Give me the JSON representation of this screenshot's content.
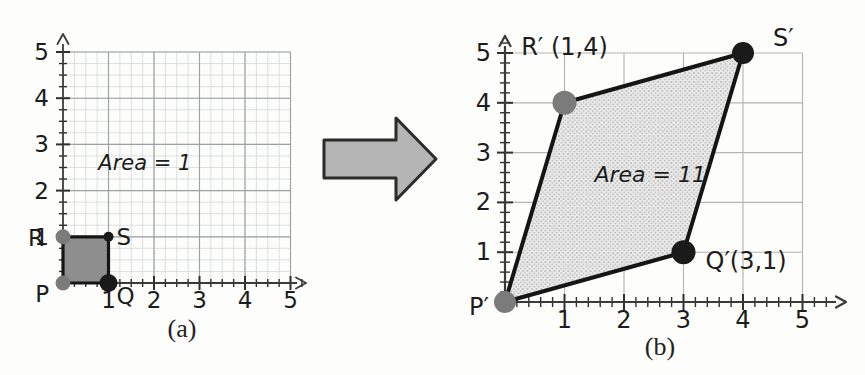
{
  "figure": {
    "captions": {
      "a": "(a)",
      "b": "(b)"
    },
    "colors": {
      "background": "#fdfdfb",
      "fine_grid": "#ced3d7",
      "major_grid_a": "#9ca1a5",
      "grid_b": "#b5b5b5",
      "axis": "#3a3a3a",
      "tick": "#2f2f2f",
      "text": "#1c1c1c",
      "square_fill": "#8e8e8e",
      "parallelogram_fill_base": "#eaeaea",
      "parallelogram_stipple": "#969696",
      "shape_stroke": "#151515",
      "gray_dot": "#7b7b7b",
      "black_dot": "#1a1a1a",
      "arrow_fill": "#b5b5b5",
      "arrow_stroke": "#2b2b2b"
    },
    "transform_arrow": {
      "direction": "right"
    }
  },
  "chart_data": [
    {
      "id": "a",
      "type": "scatter",
      "caption": "(a)",
      "xlim": [
        0,
        5
      ],
      "ylim": [
        0,
        5
      ],
      "x_tick_labels": [
        "1",
        "2",
        "3",
        "4",
        "5"
      ],
      "y_tick_labels": [
        "1",
        "2",
        "3",
        "4",
        "5"
      ],
      "minor_tick_step": 0.25,
      "grid": {
        "fine": true,
        "major": true
      },
      "area_annotation": {
        "text": "Area = 1",
        "x": 1.8,
        "y": 2.45
      },
      "shape": {
        "name": "unit-square-PQSR",
        "area": 1,
        "fill_style": "solid",
        "vertices": [
          {
            "label": "P",
            "x": 0,
            "y": 0,
            "dot": "gray",
            "dot_r": 7.5
          },
          {
            "label": "Q",
            "x": 1,
            "y": 0,
            "dot": "black",
            "dot_r": 9
          },
          {
            "label": "S",
            "x": 1,
            "y": 1,
            "dot": "black",
            "dot_r": 5
          },
          {
            "label": "R",
            "x": 0,
            "y": 1,
            "dot": "gray",
            "dot_r": 7.5
          }
        ]
      }
    },
    {
      "id": "b",
      "type": "scatter",
      "caption": "(b)",
      "xlim": [
        0,
        5
      ],
      "ylim": [
        0,
        5
      ],
      "x_tick_labels": [
        "1",
        "2",
        "3",
        "4",
        "5"
      ],
      "y_tick_labels": [
        "1",
        "2",
        "3",
        "4",
        "5"
      ],
      "minor_tick_step": 0.2,
      "grid": {
        "fine": false,
        "major": true
      },
      "area_annotation": {
        "text": "Area = 11",
        "x": 2.44,
        "y": 2.4
      },
      "shape": {
        "name": "parallelogram-P'Q'S'R'",
        "area": 11,
        "fill_style": "stipple",
        "vertices": [
          {
            "label": "P′",
            "x": 0,
            "y": 0,
            "dot": "gray",
            "dot_r": 11
          },
          {
            "label": "Q′(3,1)",
            "x": 3,
            "y": 1,
            "dot": "black",
            "dot_r": 12
          },
          {
            "label": "S′",
            "x": 4,
            "y": 5,
            "dot": "black",
            "dot_r": 11
          },
          {
            "label": "R′ (1,4)",
            "x": 1,
            "y": 4,
            "dot": "gray",
            "dot_r": 12
          }
        ]
      }
    }
  ]
}
